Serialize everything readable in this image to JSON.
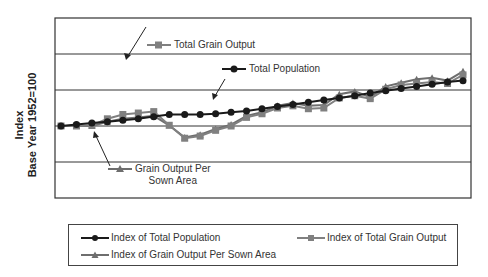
{
  "chart_data": {
    "type": "line",
    "title": "",
    "xlabel": "",
    "ylabel": "Index\nBase Year 1952=100",
    "ylabel_line1": "Index",
    "ylabel_line2": "Base Year 1952=100",
    "x": [
      1952,
      1953,
      1954,
      1955,
      1956,
      1957,
      1958,
      1959,
      1960,
      1961,
      1962,
      1963,
      1964,
      1965,
      1966,
      1967,
      1968,
      1969,
      1970,
      1971,
      1972,
      1973,
      1974,
      1975,
      1976,
      1977,
      1978
    ],
    "ylim": [
      0,
      250
    ],
    "gridlines_y": [
      50,
      100,
      150,
      200
    ],
    "grid": true,
    "series": [
      {
        "name": "Index of Total Population",
        "marker": "circle",
        "color": "#1a1a1a",
        "values": [
          100,
          102,
          104,
          106,
          108,
          110,
          113,
          116,
          116,
          116,
          117,
          119,
          121,
          124,
          127,
          130,
          133,
          136,
          139,
          142,
          146,
          149,
          152,
          155,
          158,
          161,
          163
        ]
      },
      {
        "name": "Index of Total Grain Output",
        "marker": "square",
        "color": "#808080",
        "values": [
          100,
          100,
          101,
          110,
          116,
          118,
          120,
          101,
          83,
          86,
          94,
          100,
          112,
          117,
          125,
          128,
          124,
          125,
          139,
          142,
          138,
          151,
          157,
          159,
          161,
          159,
          171
        ]
      },
      {
        "name": "Index of Grain Output Per Sown Area",
        "marker": "triangle",
        "color": "#6e6e6e",
        "values": [
          100,
          100,
          100,
          106,
          110,
          112,
          114,
          101,
          84,
          88,
          96,
          102,
          114,
          119,
          128,
          132,
          128,
          129,
          144,
          148,
          140,
          155,
          160,
          165,
          167,
          163,
          176
        ]
      }
    ],
    "legend": {
      "position": "bottom",
      "boxed": true
    },
    "annotations": [
      {
        "text": "Total Grain Output",
        "marker": "square"
      },
      {
        "text": "Total Population",
        "marker": "circle"
      },
      {
        "text": "Grain Output Per Sown Area",
        "marker": "triangle"
      }
    ]
  },
  "labels": {
    "ylabel_line1": "Index",
    "ylabel_line2": "Base Year 1952=100",
    "annot_grain": "Total Grain Output",
    "annot_pop": "Total Population",
    "annot_area_line1": "Grain Output Per",
    "annot_area_line2": "Sown Area",
    "legend_pop": "Index of Total Population",
    "legend_grain": "Index of Total Grain Output",
    "legend_area": "Index of Grain Output Per Sown Area"
  }
}
